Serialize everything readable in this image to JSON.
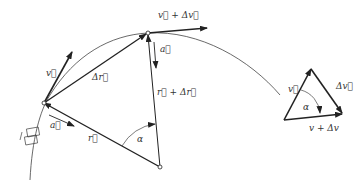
{
  "diagram": {
    "labels": {
      "v": "v⃗",
      "v_plus_dv": "v⃗ + Δv⃗",
      "delta_r": "Δr⃗",
      "a_top": "a⃗",
      "r_plus_dr": "r⃗ + Δr⃗",
      "a_left": "a⃗",
      "r": "r⃗",
      "alpha": "α"
    },
    "triangle": {
      "v": "v⃗",
      "delta_v": "Δv⃗",
      "alpha": "α",
      "v_plus_dv": "v + Δv"
    },
    "colors": {
      "stroke": "#222222",
      "arc": "#444444"
    }
  }
}
